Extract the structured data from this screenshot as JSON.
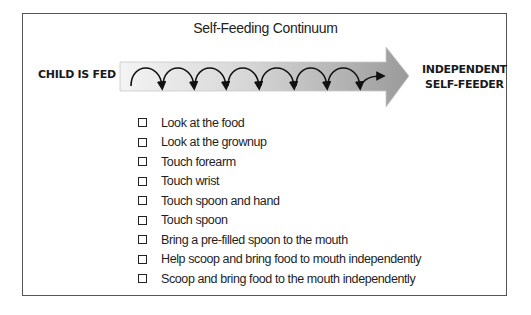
{
  "title": "Self-Feeding Continuum",
  "continuum": {
    "start_label": "CHILD IS FED",
    "end_label_line1": "INDEPENDENT",
    "end_label_line2": "SELF-FEEDER",
    "loop_count": 7,
    "gradient_start": "#f2f2f2",
    "gradient_end": "#9a9a9a"
  },
  "checklist": [
    {
      "label": "Look at the food",
      "checked": false
    },
    {
      "label": "Look at the grownup",
      "checked": false
    },
    {
      "label": "Touch forearm",
      "checked": false
    },
    {
      "label": "Touch wrist",
      "checked": false
    },
    {
      "label": "Touch spoon and hand",
      "checked": false
    },
    {
      "label": "Touch spoon",
      "checked": false
    },
    {
      "label": "Bring a pre-filled spoon to the mouth",
      "checked": false
    },
    {
      "label": "Help scoop and bring food to mouth independently",
      "checked": false
    },
    {
      "label": "Scoop and bring food to the mouth independently",
      "checked": false
    }
  ]
}
